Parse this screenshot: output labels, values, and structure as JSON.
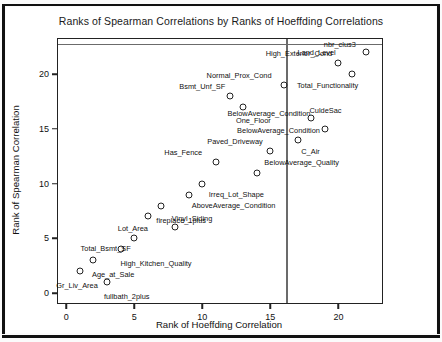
{
  "chart_data": {
    "type": "scatter",
    "title": "Ranks of Spearman Correlations by Ranks of Hoeffding Correlations",
    "xlabel": "Rank of Hoeffding Correlation",
    "ylabel": "Rank of Spearman Correlation",
    "xlim": [
      -0.6,
      23.2
    ],
    "ylim": [
      -0.9,
      23.2
    ],
    "xticks": [
      0,
      5,
      10,
      15,
      20
    ],
    "yticks": [
      0,
      5,
      10,
      15,
      20
    ],
    "grid": false,
    "legend": "none",
    "marker": "open-circle",
    "annotations": {
      "vertical_reference_line_x": 16.15,
      "horizontal_reference_line_y": 22.75
    },
    "points": [
      {
        "label": "Gr_Liv_Area",
        "x": 1,
        "y": 2,
        "label_dx": -0.2,
        "label_dy": -1.25,
        "anchor": "end"
      },
      {
        "label": "Age_at_Sale",
        "x": 2,
        "y": 3,
        "label_dx": 1.45,
        "label_dy": -1.25,
        "anchor": "middle"
      },
      {
        "label": "fullbath_2plus",
        "x": 3,
        "y": 1,
        "label_dx": 1.45,
        "label_dy": -1.25,
        "anchor": "middle"
      },
      {
        "label": "High_Kitchen_Quality",
        "x": 4,
        "y": 4,
        "label_dx": 2.6,
        "label_dy": -1.25,
        "anchor": "middle"
      },
      {
        "label": "Total_Bsmt_SF",
        "x": 5,
        "y": 5,
        "label_dx": -2.1,
        "label_dy": -0.85,
        "anchor": "middle"
      },
      {
        "label": "Lot_Area",
        "x": 6,
        "y": 7,
        "label_dx": -1.1,
        "label_dy": -1.05,
        "anchor": "middle"
      },
      {
        "label": "fireplace_1plus",
        "x": 7,
        "y": 8,
        "label_dx": 1.45,
        "label_dy": -1.35,
        "anchor": "middle"
      },
      {
        "label": "Vinyl_Siding",
        "x": 8,
        "y": 6,
        "label_dx": 1.25,
        "label_dy": 0.85,
        "anchor": "middle"
      },
      {
        "label": "AboveAverage_Condition",
        "x": 9,
        "y": 9,
        "label_dx": 3.3,
        "label_dy": -0.95,
        "anchor": "middle"
      },
      {
        "label": "Irreq_Lot_Shape",
        "x": 10,
        "y": 10,
        "label_dx": 2.5,
        "label_dy": -0.95,
        "anchor": "middle"
      },
      {
        "label": "Has_Fence",
        "x": 11,
        "y": 12,
        "label_dx": -2.4,
        "label_dy": 0.85,
        "anchor": "middle"
      },
      {
        "label": "Bsmt_Unf_SF",
        "x": 12,
        "y": 18,
        "label_dx": -2.0,
        "label_dy": 0.95,
        "anchor": "middle"
      },
      {
        "label": "One_Floor",
        "x": 13,
        "y": 17,
        "label_dx": 0.75,
        "label_dy": -1.15,
        "anchor": "middle"
      },
      {
        "label": "BelowAverage_Quality",
        "x": 14,
        "y": 11,
        "label_dx": 3.3,
        "label_dy": 0.95,
        "anchor": "middle"
      },
      {
        "label": "Paved_Driveway",
        "x": 15,
        "y": 13,
        "label_dx": -2.6,
        "label_dy": 0.85,
        "anchor": "middle"
      },
      {
        "label": "Normal_Prox_Cond",
        "x": 16,
        "y": 19,
        "label_dx": -3.3,
        "label_dy": 0.95,
        "anchor": "middle"
      },
      {
        "label": "C_Air",
        "x": 17,
        "y": 14,
        "label_dx": 0.95,
        "label_dy": -1.05,
        "anchor": "middle"
      },
      {
        "label": "BelowAverage_Condition",
        "x": 18,
        "y": 16,
        "label_dx": -2.4,
        "label_dy": -1.15,
        "anchor": "middle"
      },
      {
        "label": "CuldeSac",
        "x": 19,
        "y": 15,
        "label_dx": 0.05,
        "label_dy": 1.75,
        "anchor": "middle"
      },
      {
        "label": "High_Exterior_Cond",
        "x": 20,
        "y": 21,
        "label_dx": -2.9,
        "label_dy": 0.95,
        "anchor": "middle"
      },
      {
        "label": "Land_Level",
        "x": 21,
        "y": 20,
        "label_dx": -2.6,
        "label_dy": 2.05,
        "anchor": "middle"
      },
      {
        "label": "nbr_clus3",
        "x": 22,
        "y": 22,
        "label_dx": -1.9,
        "label_dy": 0.75,
        "anchor": "middle"
      }
    ],
    "extra_labels": [
      {
        "label": "Total_Functionality",
        "x": 19.2,
        "y": 19.0
      },
      {
        "label": "BelowAverage_Condition",
        "x": 14.9,
        "y": 16.4
      }
    ]
  }
}
